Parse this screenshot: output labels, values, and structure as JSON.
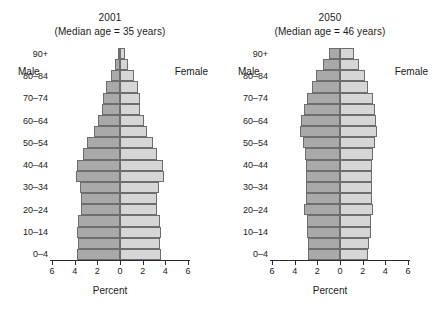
{
  "figure": {
    "background": "#ffffff",
    "male_color": "#a9a9a9",
    "female_color": "#d6d6d6",
    "line_color": "#6d6d6d"
  },
  "panels": [
    {
      "id": "panel-2001",
      "title": "2001",
      "subtitle": "(Median age = 35 years)",
      "male_label": "Male",
      "female_label": "Female",
      "xlabel": "Percent"
    },
    {
      "id": "panel-2050",
      "title": "2050",
      "subtitle": "(Median age = 46 years)",
      "male_label": "Male",
      "female_label": "Female",
      "xlabel": "Percent"
    }
  ],
  "axis": {
    "tick_labels": [
      "6",
      "4",
      "2",
      "0",
      "2",
      "4",
      "6"
    ],
    "tick_values": [
      -6,
      -4,
      -2,
      0,
      2,
      4,
      6
    ],
    "xlim": [
      -6,
      6
    ]
  },
  "y_axis": {
    "visible_labels": [
      "90+",
      "80–84",
      "70–74",
      "60–64",
      "50–54",
      "40–44",
      "30–34",
      "20–24",
      "10–14",
      "0–4"
    ]
  },
  "chart_data": {
    "type": "bar",
    "subtitle": "Percent of total population by age group and sex",
    "xlabel": "Percent",
    "ylabel": "Age group",
    "xlim": [
      -6,
      6
    ],
    "grid": false,
    "legend": [
      "Male",
      "Female"
    ],
    "legend_position": "inside-top",
    "orientation": "population-pyramid",
    "note": "Male values plotted to the left of zero, female values to the right. Axis labels show absolute percent on both sides.",
    "age_groups": [
      "0–4",
      "5–9",
      "10–14",
      "15–19",
      "20–24",
      "25–29",
      "30–34",
      "35–39",
      "40–44",
      "45–49",
      "50–54",
      "55–59",
      "60–64",
      "65–69",
      "70–74",
      "75–79",
      "80–84",
      "85–89",
      "90+"
    ],
    "panels": [
      {
        "year": "2001",
        "median_age": 35,
        "median_age_label": "(Median age = 35 years)",
        "series": [
          {
            "name": "Male",
            "values": [
              3.8,
              3.7,
              3.8,
              3.7,
              3.4,
              3.4,
              3.5,
              3.9,
              3.8,
              3.3,
              2.9,
              2.3,
              1.9,
              1.6,
              1.5,
              1.2,
              0.8,
              0.4,
              0.2
            ]
          },
          {
            "name": "Female",
            "values": [
              3.6,
              3.5,
              3.6,
              3.5,
              3.3,
              3.3,
              3.4,
              3.9,
              3.8,
              3.3,
              2.9,
              2.4,
              2.1,
              1.8,
              1.8,
              1.6,
              1.2,
              0.7,
              0.4
            ]
          }
        ]
      },
      {
        "year": "2050",
        "median_age": 46,
        "median_age_label": "(Median age = 46 years)",
        "series": [
          {
            "name": "Male",
            "values": [
              2.8,
              2.8,
              2.9,
              2.9,
              3.2,
              3.0,
              3.0,
              3.0,
              3.0,
              3.1,
              3.3,
              3.5,
              3.4,
              3.2,
              2.9,
              2.5,
              2.1,
              1.5,
              1.0
            ]
          },
          {
            "name": "Female",
            "values": [
              2.5,
              2.6,
              2.7,
              2.7,
              2.9,
              2.8,
              2.8,
              2.8,
              2.8,
              2.9,
              3.1,
              3.3,
              3.2,
              3.1,
              2.9,
              2.5,
              2.2,
              1.7,
              1.2
            ]
          }
        ]
      }
    ]
  }
}
